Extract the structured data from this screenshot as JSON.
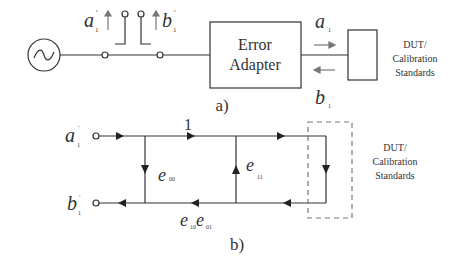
{
  "part_a": {
    "caption": "a)",
    "source": {
      "icon": "ac-source-icon"
    },
    "incident_label": {
      "main": "a",
      "sub": "1",
      "sup": "′"
    },
    "reflected_label": {
      "main": "b",
      "sub": "1",
      "sup": "′"
    },
    "adapter": {
      "line1": "Error",
      "line2": "Adapter"
    },
    "wave_a": {
      "main": "a",
      "sub": "1"
    },
    "wave_b": {
      "main": "b",
      "sub": "1"
    },
    "dut": {
      "line1": "DUT/",
      "line2": "Calibration",
      "line3": "Standards"
    }
  },
  "part_b": {
    "caption": "b)",
    "port_a": {
      "main": "a",
      "sub": "1",
      "sup": "′"
    },
    "port_b": {
      "main": "b",
      "sub": "1",
      "sup": "′"
    },
    "branch_top": "1",
    "e00": {
      "main": "e",
      "sub": "00"
    },
    "e11": {
      "main": "e",
      "sub": "11"
    },
    "e10e01": {
      "main1": "e",
      "sub1": "10",
      "main2": "e",
      "sub2": "01"
    },
    "dut": {
      "line1": "DUT/",
      "line2": "Calibration",
      "line3": "Standards"
    }
  },
  "colors": {
    "line": "#333333",
    "gray_arrow": "#777777",
    "dash": "#777777"
  }
}
